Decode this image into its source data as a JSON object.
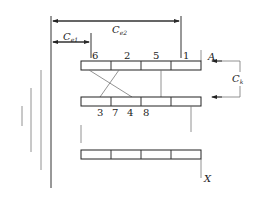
{
  "diagram": {
    "dimensions": {
      "ce2": {
        "symbol": "C",
        "subscript": "e2"
      },
      "ce1": {
        "symbol": "C",
        "subscript": "e1"
      },
      "ck": {
        "symbol": "C",
        "subscript": "k"
      }
    },
    "markers": {
      "top": "A",
      "bottom": "X"
    },
    "top_bar": {
      "labels": [
        "6",
        "2",
        "5",
        "1"
      ]
    },
    "middle_bar": {
      "labels": [
        "3",
        "7",
        "4",
        "8"
      ]
    },
    "bottom_bar": {
      "segments": 4
    },
    "colors": {
      "line": "#333333",
      "background": "#ffffff"
    }
  }
}
